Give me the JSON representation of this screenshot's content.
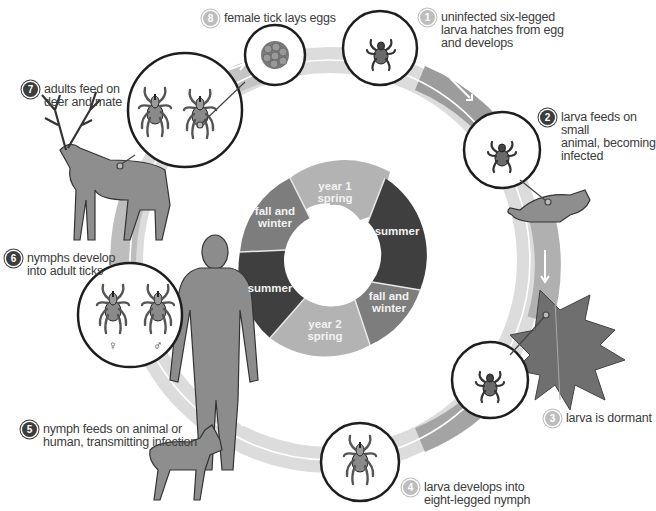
{
  "colors": {
    "ring_light": "#d4d4d4",
    "ring_mid": "#a9a9a9",
    "ring_dark": "#8a8a8a",
    "seg_spring": "#b3b3b3",
    "seg_summer": "#3f3f3f",
    "seg_fall": "#7d7d7d",
    "badge_light": "#bdbdbd",
    "badge_dark": "#3d3d3d",
    "outline": "#1e1e1e"
  },
  "steps": [
    {
      "number": "1",
      "style": "light",
      "lines": [
        "uninfected six-legged",
        "larva hatches from egg",
        "and develops"
      ]
    },
    {
      "number": "2",
      "style": "dark",
      "lines": [
        "larva feeds on small",
        "animal, becoming",
        "infected"
      ]
    },
    {
      "number": "3",
      "style": "light",
      "lines": [
        "larva is dormant"
      ]
    },
    {
      "number": "4",
      "style": "light",
      "lines": [
        "larva develops into",
        "eight-legged nymph"
      ]
    },
    {
      "number": "5",
      "style": "dark",
      "lines": [
        "nymph feeds on animal or",
        "human, transmitting infection"
      ]
    },
    {
      "number": "6",
      "style": "dark",
      "lines": [
        "nymphs develop",
        "into adult ticks"
      ]
    },
    {
      "number": "7",
      "style": "dark",
      "lines": [
        "adults feed on",
        "deer and mate"
      ]
    },
    {
      "number": "8",
      "style": "light",
      "lines": [
        "female tick lays eggs"
      ]
    }
  ],
  "seasons": [
    {
      "id": "year1-spring",
      "lines": [
        "year 1",
        "spring"
      ],
      "tone": "spring"
    },
    {
      "id": "summer-1",
      "lines": [
        "summer"
      ],
      "tone": "summer"
    },
    {
      "id": "fall-winter-1",
      "lines": [
        "fall and",
        "winter"
      ],
      "tone": "fall"
    },
    {
      "id": "year2-spring",
      "lines": [
        "year 2",
        "spring"
      ],
      "tone": "spring"
    },
    {
      "id": "summer-2",
      "lines": [
        "summer"
      ],
      "tone": "summer"
    },
    {
      "id": "fall-winter-2",
      "lines": [
        "fall and",
        "winter"
      ],
      "tone": "fall"
    }
  ],
  "symbols": {
    "female": "♀",
    "male": "♂"
  },
  "illustrations": [
    "eggs",
    "larva",
    "mouse",
    "maple-leaf",
    "nymph",
    "dog",
    "human",
    "adult-ticks",
    "deer"
  ]
}
